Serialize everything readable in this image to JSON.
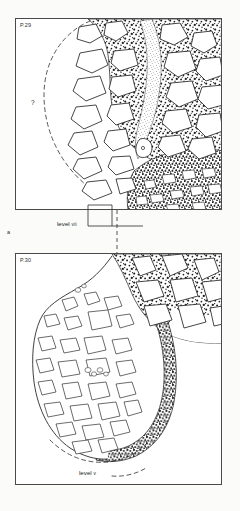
{
  "figure": {
    "caption_parts": [
      {
        "label": "a",
        "x": 7,
        "y": 232
      }
    ]
  },
  "panels": [
    {
      "id": "panel-top",
      "label": "P.29",
      "x": 15,
      "y": 18,
      "width": 207,
      "height": 192,
      "annotation": {
        "text": "level ",
        "roman": "vii",
        "x": 57,
        "y": 224
      },
      "query_marker": {
        "text": "?",
        "x": 33,
        "y": 103
      },
      "description_zones": [
        {
          "name": "stony-matrix-fill",
          "pattern": "coarse-stipple-with-angular-clasts"
        },
        {
          "name": "fine-silt-band",
          "pattern": "fine-light-stipple"
        },
        {
          "name": "basal-gravel",
          "pattern": "dense-fine-stipple-small-clasts"
        },
        {
          "name": "projected-pit-edge",
          "pattern": "dashed-arc"
        }
      ]
    },
    {
      "id": "panel-bottom",
      "label": "P.30",
      "x": 15,
      "y": 253,
      "width": 207,
      "height": 232,
      "annotation": {
        "text": "level ",
        "roman": "v",
        "x": 79,
        "y": 474
      },
      "description_zones": [
        {
          "name": "pit-fill-outlined-clasts",
          "pattern": "white-ground-with-outlined-clasts"
        },
        {
          "name": "surrounding-stony-matrix",
          "pattern": "coarse-stipple-with-angular-clasts"
        },
        {
          "name": "dark-pit-lining",
          "pattern": "dense-dark-stipple-band"
        },
        {
          "name": "projected-pit-base",
          "pattern": "dashed-arc"
        }
      ]
    }
  ],
  "colors": {
    "ink": "#1a1a1a",
    "border": "#4a4a4a",
    "paper": "#ffffff",
    "page": "#fbfbfa",
    "stipple": "#262626",
    "clast_fill": "#ffffff",
    "clast_stroke": "#303030"
  }
}
